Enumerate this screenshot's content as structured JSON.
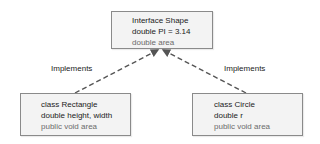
{
  "diagram": {
    "type": "uml-class-diagram",
    "nodes": [
      {
        "id": "interface-shape",
        "lines": [
          {
            "text": "Interface Shape",
            "muted": false
          },
          {
            "text": "double PI = 3.14",
            "muted": false
          },
          {
            "text": "double area",
            "muted": true
          }
        ]
      },
      {
        "id": "class-rectangle",
        "lines": [
          {
            "text": "class Rectangle",
            "muted": false
          },
          {
            "text": "double height, width",
            "muted": false
          },
          {
            "text": "public void area",
            "muted": true
          }
        ]
      },
      {
        "id": "class-circle",
        "lines": [
          {
            "text": "class Circle",
            "muted": false
          },
          {
            "text": "double r",
            "muted": false
          },
          {
            "text": "public void area",
            "muted": true
          }
        ]
      }
    ],
    "edges": [
      {
        "from": "class-rectangle",
        "to": "interface-shape",
        "label": "Implements",
        "style": "dashed-arrow"
      },
      {
        "from": "class-circle",
        "to": "interface-shape",
        "label": "Implements",
        "style": "dashed-arrow"
      }
    ],
    "colors": {
      "box_fill": "#f3f3f3",
      "box_border": "#8a8a8a",
      "text": "#222222",
      "muted_text": "#6b6b6b",
      "connector": "#555555"
    }
  }
}
